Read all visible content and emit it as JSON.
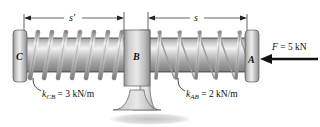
{
  "figure": {
    "background_color": "#ffffff"
  },
  "points": {
    "left_plate_label": "C",
    "middle_block_label": "B",
    "right_plate_label": "A"
  },
  "dimensions": {
    "left": {
      "label": "s",
      "prime": "′",
      "full_label": "s′",
      "description": "deflection of spring CB"
    },
    "right": {
      "label": "s",
      "prime": "",
      "full_label": "s",
      "description": "deflection of spring AB"
    }
  },
  "springs": {
    "cb": {
      "symbol": "k",
      "subscript": "CB",
      "equals": " = ",
      "value": "3 kN/m",
      "full_label": "k_CB = 3 kN/m",
      "stiffness_value": 3,
      "stiffness_units": "kN/m",
      "coil_count": 7,
      "state": "compressed"
    },
    "ab": {
      "symbol": "k",
      "subscript": "AB",
      "equals": " = ",
      "value": "2 kN/m",
      "full_label": "k_AB = 2 kN/m",
      "stiffness_value": 2,
      "stiffness_units": "kN/m",
      "coil_count": 5,
      "state": "stretched"
    }
  },
  "force": {
    "symbol": "F",
    "equals": " = ",
    "value": "5 kN",
    "full_label": "F = 5 kN",
    "magnitude": 5,
    "units": "kN",
    "direction": "left",
    "applied_at": "A",
    "arrow_color": "#111111"
  },
  "colors": {
    "metal_light": "#e2e2e2",
    "metal_mid": "#b4b4b4",
    "metal_dark": "#8a8a8a",
    "outline": "#5a5a5a",
    "text": "#111111",
    "shadow": "#d8d8d8"
  }
}
